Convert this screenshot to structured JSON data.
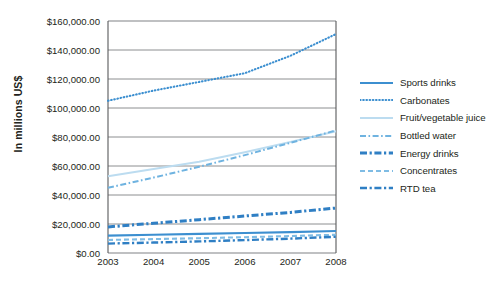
{
  "chart_data": {
    "type": "line",
    "title": "",
    "xlabel": "",
    "ylabel": "In millions US$",
    "x": [
      2003,
      2004,
      2005,
      2006,
      2007,
      2008
    ],
    "xtick_labels": [
      "2003",
      "2004",
      "2005",
      "2006",
      "2007",
      "2008"
    ],
    "ylim": [
      0,
      160000
    ],
    "ytick_values": [
      0,
      20000,
      40000,
      60000,
      80000,
      100000,
      120000,
      140000,
      160000
    ],
    "ytick_labels": [
      "$0.00",
      "$20,000.00",
      "$40,000.00",
      "$60,000.00",
      "$80,000.00",
      "$100,000.00",
      "$120,000.00",
      "$140,000.00",
      "$160,000.00"
    ],
    "grid": true,
    "legend_position": "right",
    "series": [
      {
        "name": "Sports drinks",
        "values": [
          12000,
          12600,
          13200,
          13800,
          14400,
          15200
        ],
        "color": "#3c8fd0",
        "style": "solid",
        "width": 2.1
      },
      {
        "name": "Carbonates",
        "values": [
          105000,
          112000,
          118000,
          124000,
          136000,
          151000
        ],
        "color": "#3c8fd0",
        "style": "dotted",
        "width": 2.1
      },
      {
        "name": "Fruit/vegetable juice",
        "values": [
          53000,
          58000,
          63000,
          69500,
          76500,
          84000
        ],
        "color": "#bcdcf0",
        "style": "solid",
        "width": 2.0
      },
      {
        "name": "Bottled water",
        "values": [
          45000,
          52000,
          59500,
          67500,
          76000,
          84500
        ],
        "color": "#6fb3e0",
        "style": "dashdot-thin",
        "width": 2.0
      },
      {
        "name": "Energy drinks",
        "values": [
          18000,
          20500,
          23000,
          25500,
          28000,
          31000
        ],
        "color": "#2f7fc4",
        "style": "dashdot-thick",
        "width": 3.0
      },
      {
        "name": "Concentrates",
        "values": [
          9000,
          9600,
          10200,
          10900,
          11700,
          12600
        ],
        "color": "#7fbce4",
        "style": "dashed",
        "width": 2.1
      },
      {
        "name": "RTD tea",
        "values": [
          6500,
          7200,
          8000,
          8900,
          9900,
          11200
        ],
        "color": "#2f7fc4",
        "style": "dashdot-thick",
        "width": 2.4
      }
    ]
  },
  "legend": {
    "items": [
      {
        "label": "Sports drinks"
      },
      {
        "label": "Carbonates"
      },
      {
        "label": "Fruit/vegetable juice"
      },
      {
        "label": "Bottled water"
      },
      {
        "label": "Energy drinks"
      },
      {
        "label": "Concentrates"
      },
      {
        "label": "RTD tea"
      }
    ]
  },
  "axis": {
    "y_title": "In millions US$"
  },
  "colors": {
    "grid": "#808285",
    "axis": "#58595b",
    "text": "#231f20",
    "accent": "#3c8fd0"
  }
}
